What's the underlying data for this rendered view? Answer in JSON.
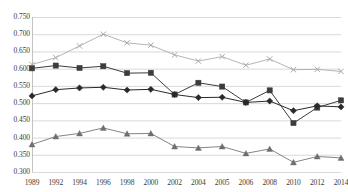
{
  "chart_data": {
    "type": "line",
    "title": "",
    "xlabel": "",
    "ylabel": "",
    "ylim": [
      0.3,
      0.75
    ],
    "ytick_labels": [
      "0.750",
      "0.700",
      "0.650",
      "0.600",
      "0.550",
      "0.500",
      "0.450",
      "0.400",
      "0.350",
      "0.300"
    ],
    "ytick_values": [
      0.75,
      0.7,
      0.65,
      0.6,
      0.55,
      0.5,
      0.45,
      0.4,
      0.35,
      0.3
    ],
    "grid": true,
    "legend": "none",
    "categories": [
      "1989",
      "1992",
      "1994",
      "1996",
      "1998",
      "2000",
      "2002",
      "2004",
      "2005",
      "2006",
      "2008",
      "2010",
      "2012",
      "2014"
    ],
    "series": [
      {
        "name": "series-x-marker",
        "marker": "x",
        "color": "#a8a8a8",
        "values": [
          0.612,
          0.632,
          0.666,
          0.7,
          0.675,
          0.668,
          0.64,
          0.622,
          0.635,
          0.61,
          0.628,
          0.597,
          0.598,
          0.592
        ]
      },
      {
        "name": "series-square-marker",
        "marker": "square",
        "color": "#3c3c3c",
        "values": [
          0.601,
          0.609,
          0.602,
          0.607,
          0.587,
          0.588,
          0.525,
          0.559,
          0.548,
          0.502,
          0.537,
          0.442,
          0.487,
          0.508
        ]
      },
      {
        "name": "series-diamond-marker",
        "marker": "diamond",
        "color": "#2a2a2a",
        "values": [
          0.521,
          0.539,
          0.544,
          0.546,
          0.538,
          0.54,
          0.525,
          0.516,
          0.517,
          0.502,
          0.506,
          0.478,
          0.492,
          0.489
        ]
      },
      {
        "name": "series-triangle-marker",
        "marker": "triangle",
        "color": "#6e6e6e",
        "values": [
          0.38,
          0.403,
          0.412,
          0.428,
          0.411,
          0.412,
          0.374,
          0.37,
          0.374,
          0.354,
          0.367,
          0.328,
          0.345,
          0.341
        ]
      }
    ]
  }
}
